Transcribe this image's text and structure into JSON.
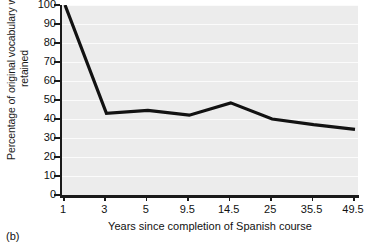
{
  "figure": {
    "panel_label": "(b)"
  },
  "chart_data": {
    "type": "line",
    "title": "",
    "xlabel": "Years since completion of Spanish course",
    "ylabel": "Percentage of original vocabulary words retained",
    "categories": [
      "1",
      "3",
      "5",
      "9.5",
      "14.5",
      "25",
      "35.5",
      "49.5"
    ],
    "x": [
      1,
      3,
      5,
      9.5,
      14.5,
      25,
      35.5,
      49.5
    ],
    "values": [
      100,
      43,
      44.5,
      42,
      48.5,
      40,
      37,
      34.5
    ],
    "series": [
      {
        "name": "Percentage of original vocabulary words retained",
        "values": [
          100,
          43,
          44.5,
          42,
          48.5,
          40,
          37,
          34.5
        ]
      }
    ],
    "xtick_labels": [
      "1",
      "3",
      "5",
      "9.5",
      "14.5",
      "25",
      "35.5",
      "49.5"
    ],
    "ytick_labels": [
      "100",
      "90",
      "80",
      "70",
      "60",
      "50",
      "40",
      "30",
      "20",
      "10",
      "0"
    ],
    "ytick_values": [
      100,
      90,
      80,
      70,
      60,
      50,
      40,
      30,
      20,
      10,
      0
    ],
    "ylim": [
      0,
      100
    ],
    "grid": true,
    "legend": "none",
    "line_color": "#121212",
    "plot_background": "#ececec",
    "gridline_color": "#fbfbfb"
  }
}
